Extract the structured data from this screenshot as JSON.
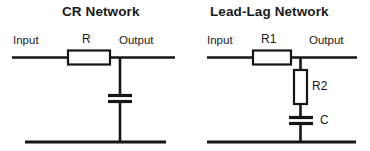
{
  "figure": {
    "background_color": "#ffffff",
    "line_color": "#151515",
    "text_color": "#1a1a1a"
  },
  "circuits": [
    {
      "id": "cr-network",
      "title": "CR Network",
      "input_label": "Input",
      "output_label": "Output",
      "series_component_label": "R",
      "shunt_component_label": "C",
      "topology": "series resistor to output node, shunt capacitor to ground rail"
    },
    {
      "id": "lead-lag-network",
      "title": "Lead-Lag Network",
      "input_label": "Input",
      "output_label": "Output",
      "series_component_label": "R1",
      "shunt_resistor_label": "R2",
      "shunt_capacitor_label": "C",
      "topology": "series resistor R1 to output node, shunt R2 in series with C to ground rail"
    }
  ]
}
